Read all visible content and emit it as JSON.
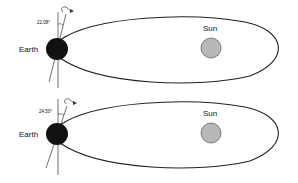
{
  "diagrams": [
    {
      "earth_label": "Earth",
      "sun_label": "Sun",
      "tilt_angle": "22.08°"
    },
    {
      "earth_label": "Earth",
      "sun_label": "Sun",
      "tilt_angle": "24.50°"
    }
  ],
  "colors": {
    "earth": "#111111",
    "sun_fill": "#b8b8b8",
    "sun_stroke": "#555555",
    "orbit": "#222222"
  }
}
